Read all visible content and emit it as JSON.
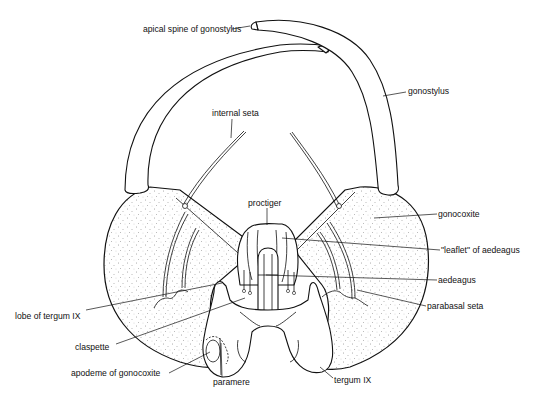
{
  "figure": {
    "labels": [
      {
        "id": "apical-spine-of-gonostylus",
        "text": "apical spine of gonostylus",
        "x": 143,
        "y": 32,
        "anchor": "start",
        "leader": [
          [
            232,
            29
          ],
          [
            250,
            26
          ]
        ]
      },
      {
        "id": "gonostylus",
        "text": "gonostylus",
        "x": 408,
        "y": 94,
        "anchor": "start",
        "leader": [
          [
            383,
            96
          ],
          [
            406,
            92
          ]
        ]
      },
      {
        "id": "internal-seta",
        "text": "internal seta",
        "x": 212,
        "y": 116,
        "anchor": "start",
        "leader": [
          [
            232,
            119
          ],
          [
            231,
            138
          ]
        ]
      },
      {
        "id": "proctiger",
        "text": "proctiger",
        "x": 248,
        "y": 206,
        "anchor": "start",
        "leader": [
          [
            267,
            208
          ],
          [
            267,
            225
          ]
        ]
      },
      {
        "id": "gonocoxite",
        "text": "gonocoxite",
        "x": 438,
        "y": 217,
        "anchor": "start",
        "leader": [
          [
            374,
            218
          ],
          [
            437,
            214
          ]
        ]
      },
      {
        "id": "leaflet-of-aedeagus",
        "text": "\"leaflet\" of aedeagus",
        "x": 441,
        "y": 253,
        "anchor": "start",
        "leader": [
          [
            282,
            238
          ],
          [
            440,
            250
          ]
        ]
      },
      {
        "id": "aedeagus",
        "text": "aedeagus",
        "x": 438,
        "y": 283,
        "anchor": "start",
        "leader": [
          [
            266,
            275
          ],
          [
            437,
            280
          ]
        ]
      },
      {
        "id": "lobe-of-tergum-IX",
        "text": "lobe of tergum IX",
        "x": 15,
        "y": 319,
        "anchor": "start",
        "leader": [
          [
            86,
            310
          ],
          [
            222,
            283
          ]
        ]
      },
      {
        "id": "parabasal-seta",
        "text": "parabasal seta",
        "x": 427,
        "y": 309,
        "anchor": "start",
        "leader": [
          [
            357,
            290
          ],
          [
            426,
            306
          ]
        ]
      },
      {
        "id": "claspette",
        "text": "claspette",
        "x": 75,
        "y": 350,
        "anchor": "start",
        "leader": [
          [
            116,
            344
          ],
          [
            245,
            298
          ]
        ]
      },
      {
        "id": "apodeme-of-gonocoxite",
        "text": "apodeme of gonocoxite",
        "x": 71,
        "y": 376,
        "anchor": "start",
        "leader": [
          [
            169,
            373
          ],
          [
            210,
            352
          ]
        ]
      },
      {
        "id": "paramere",
        "text": "paramere",
        "x": 213,
        "y": 385,
        "anchor": "start",
        "leader": [
          [
            222,
            377
          ],
          [
            221,
            343
          ]
        ]
      },
      {
        "id": "tergum-IX",
        "text": "tergum IX",
        "x": 334,
        "y": 383,
        "anchor": "start",
        "leader": [
          [
            333,
            378
          ],
          [
            320,
            367
          ]
        ]
      }
    ]
  },
  "colors": {
    "ink": "#111111",
    "paper": "#ffffff",
    "stipple": "#555555"
  }
}
